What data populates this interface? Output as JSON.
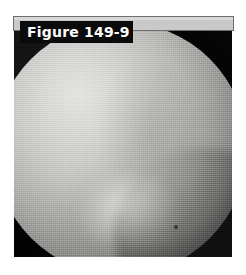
{
  "figure": {
    "label": "Figure 149-9",
    "label_background": "#0b0b0b",
    "label_text_color": "#ffffff",
    "header_bar_color": "#c9c9c9",
    "header_bar_border_color": "#6e6e6e",
    "page_background": "#ffffff"
  },
  "image": {
    "alt": "Grayscale endoscopic photograph showing a large rounded bright tissue mass filling the circular field of view, with dark vignetted corners at upper right and lower left, a bright highlight upper-left of centre, a secondary bright lobe lower centre, and a dark curved shadow boundary sweeping through the lower-right quadrant.",
    "modality": "endoscopic-photograph",
    "color_mode": "grayscale",
    "frame_background": "#141414",
    "highlight_color": "#e3e3e1",
    "midtone_color": "#9e9e9c",
    "shadow_color": "#0d0d0d"
  }
}
